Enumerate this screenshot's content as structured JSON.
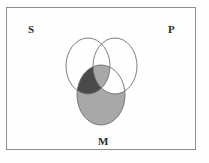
{
  "figure": {
    "type": "venn-diagram",
    "title": "",
    "frame": {
      "x": 6,
      "y": 7,
      "width": 190,
      "height": 143,
      "border_color": "#8d8d8d"
    },
    "labels": [
      {
        "id": "S",
        "text": "S",
        "x": 28,
        "y": 24
      },
      {
        "id": "P",
        "text": "P",
        "x": 168,
        "y": 24
      },
      {
        "id": "M",
        "text": "M",
        "x": 98,
        "y": 136
      }
    ],
    "circles": [
      {
        "id": "S",
        "cx": 88,
        "cy": 66,
        "rx": 22,
        "ry": 28,
        "stroke": "#6e6e6e"
      },
      {
        "id": "P",
        "cx": 115,
        "cy": 66,
        "rx": 22,
        "ry": 28,
        "stroke": "#6e6e6e"
      },
      {
        "id": "M",
        "cx": 101,
        "cy": 95,
        "rx": 24,
        "ry": 30,
        "stroke": "#6e6e6e"
      }
    ],
    "shading": {
      "light_gray": "#a8a8a8",
      "dark_gray": "#4a4a4a",
      "white": "#ffffff",
      "regions": [
        {
          "name": "M-only",
          "fill": "light_gray"
        },
        {
          "name": "S-and-M-not-P",
          "fill": "dark_gray"
        },
        {
          "name": "S-and-M-and-P",
          "fill": "light_gray"
        },
        {
          "name": "M-and-P-not-S",
          "fill": "white"
        }
      ]
    },
    "background": "#fefefe"
  }
}
